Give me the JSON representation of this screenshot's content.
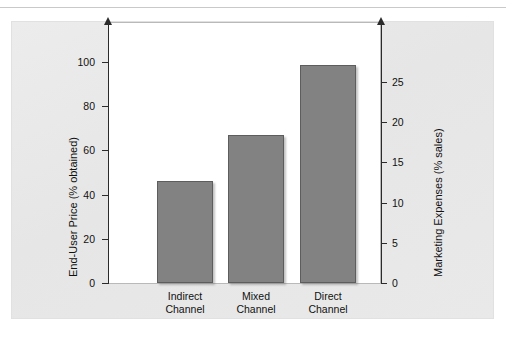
{
  "page": {
    "running_head": "PRICING AND PROFITABILITY ACROSS DISTRIBUTION CHANNELS"
  },
  "chart_data": {
    "type": "bar",
    "title": "",
    "categories": [
      "Indirect\nChannel",
      "Mixed\nChannel",
      "Direct\nChannel"
    ],
    "category_lines": [
      [
        "Indirect",
        "Channel"
      ],
      [
        "Mixed",
        "Channel"
      ],
      [
        "Direct",
        "Channel"
      ]
    ],
    "values": [
      46,
      67,
      98.5
    ],
    "series": [
      {
        "name": "End-User Price (% obtained)",
        "values": [
          46,
          67,
          98.5
        ]
      }
    ],
    "xlabel": "",
    "ylabel": "End-User Price (% obtained)",
    "ylabel_right": "Marketing Expenses (% sales)",
    "ylim": [
      0,
      110
    ],
    "ylim_right": [
      0,
      27.5
    ],
    "yticks": [
      0,
      20,
      40,
      60,
      80,
      100
    ],
    "yticks_right": [
      0,
      5,
      10,
      15,
      20,
      25
    ],
    "grid": false,
    "legend": "none",
    "bar_color": "#828282",
    "axis_color": "#2b2b2b",
    "panel_color": "#e8e8e8",
    "plot_background": "#ffffff"
  },
  "axes": {
    "left": {
      "title": "End-User Price (% obtained)",
      "ticks": [
        "0",
        "20",
        "40",
        "60",
        "80",
        "100"
      ]
    },
    "right": {
      "title": "Marketing Expenses (% sales)",
      "ticks": [
        "0",
        "5",
        "10",
        "15",
        "20",
        "25"
      ]
    }
  }
}
